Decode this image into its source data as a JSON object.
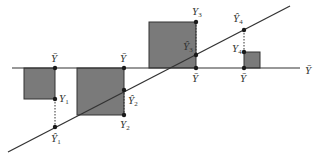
{
  "colors": {
    "background": "#ffffff",
    "box_fill": "#7a7a7a",
    "line": "#333333",
    "point": "#1a1a1a"
  },
  "axis": {
    "label": "Ȳ",
    "label_x": 305,
    "label_y": 74
  },
  "mean_line": {
    "x1": 12,
    "x2": 300,
    "y": 68
  },
  "regression_line": {
    "x1": 8,
    "y1": 152,
    "x2": 290,
    "y2": 6
  },
  "boxes": [
    {
      "x": 24,
      "y": 68,
      "w": 31,
      "h": 31
    },
    {
      "x": 77,
      "y": 68,
      "w": 47,
      "h": 47
    },
    {
      "x": 149,
      "y": 22,
      "w": 47,
      "h": 46
    },
    {
      "x": 244,
      "y": 52,
      "w": 16,
      "h": 16
    }
  ],
  "observations": [
    {
      "x": 55,
      "y_obs": 99,
      "y_hat": 127,
      "y_mean": 68,
      "mean_label": "Ȳ",
      "mean_label_pos": [
        51,
        62
      ],
      "obs_label": "Y",
      "obs_sub": "1",
      "obs_label_pos": [
        59,
        102
      ],
      "hat_label": "Ŷ",
      "hat_sub": "1",
      "hat_label_pos": [
        51,
        142
      ]
    },
    {
      "x": 124,
      "y_obs": 115,
      "y_hat": 90,
      "y_mean": 68,
      "mean_label": "Ȳ",
      "mean_label_pos": [
        120,
        62
      ],
      "obs_label": "Y",
      "obs_sub": "2",
      "obs_label_pos": [
        120,
        128
      ],
      "hat_label": "Ŷ",
      "hat_sub": "2",
      "hat_label_pos": [
        128,
        104
      ]
    },
    {
      "x": 196,
      "y_obs": 22,
      "y_hat": 55,
      "y_mean": 68,
      "mean_label": "Ȳ",
      "mean_label_pos": [
        192,
        82
      ],
      "obs_label": "Y",
      "obs_sub": "3",
      "obs_label_pos": [
        192,
        15
      ],
      "hat_label": "Ŷ",
      "hat_sub": "3",
      "hat_label_pos": [
        183,
        50
      ]
    },
    {
      "x": 244,
      "y_obs": 52,
      "y_hat": 30,
      "y_mean": 68,
      "mean_label": "Ȳ",
      "mean_label_pos": [
        240,
        82
      ],
      "obs_label": "Y",
      "obs_sub": "4",
      "obs_label_pos": [
        232,
        52
      ],
      "hat_label": "Ŷ",
      "hat_sub": "4",
      "hat_label_pos": [
        233,
        22
      ]
    }
  ]
}
